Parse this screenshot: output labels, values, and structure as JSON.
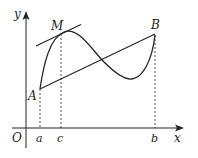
{
  "diagram": {
    "title": "",
    "axes": {
      "x_label": "x",
      "y_label": "y",
      "origin_label": "O"
    },
    "points": {
      "A": "A",
      "M": "M",
      "B": "B"
    },
    "ticks": {
      "a": "a",
      "c": "c",
      "b": "b"
    },
    "elements": [
      "curve from A through M (local max) and a local min to B",
      "secant line AB",
      "tangent line at M parallel to AB",
      "dashed verticals from A, M, B down to a, c, b on x-axis"
    ],
    "colors": {
      "stroke": "#222222",
      "background": "#ffffff"
    }
  }
}
